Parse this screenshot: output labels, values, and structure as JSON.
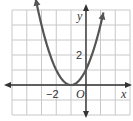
{
  "chart_data": {
    "type": "line",
    "title": "",
    "function": "y = (x + 1)^2",
    "series": [
      {
        "name": "parabola",
        "x": [
          -3.4,
          -3,
          -2,
          -1,
          0,
          1,
          1.2
        ],
        "y": [
          5.76,
          4,
          1,
          0,
          1,
          4,
          4.84
        ]
      }
    ],
    "xlabel": "x",
    "ylabel": "y",
    "origin_label": "O",
    "tick_labels": {
      "x": [
        "-2"
      ],
      "y": [
        "2"
      ]
    },
    "xlim": [
      -5,
      3
    ],
    "ylim": [
      -2,
      5
    ],
    "grid": true,
    "colors": {
      "curve": "#555555",
      "axis": "#333333",
      "grid": "#c8c8c8"
    }
  },
  "labels": {
    "x_axis": "x",
    "y_axis": "y",
    "origin": "O",
    "x_tick": "−2",
    "y_tick": "2"
  }
}
